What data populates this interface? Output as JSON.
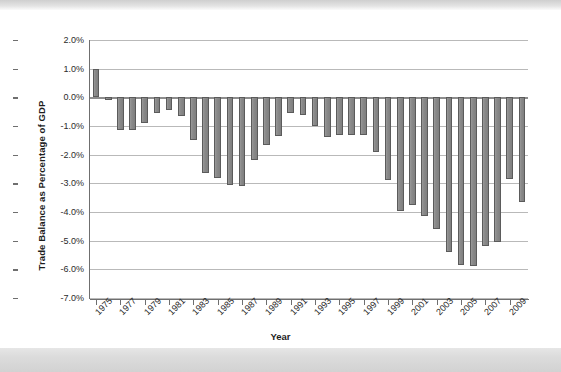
{
  "chart_data": {
    "type": "bar",
    "title": "",
    "xlabel": "Year",
    "ylabel": "Trade Balance as Percentage of GDP",
    "ylim": [
      -7.0,
      2.0
    ],
    "ystep": 1.0,
    "yticks": [
      "2.0%",
      "1.0%",
      "0.0%",
      "-1.0%",
      "-2.0%",
      "-3.0%",
      "-4.0%",
      "-5.0%",
      "-6.0%",
      "-7.0%"
    ],
    "ytick_values": [
      2.0,
      1.0,
      0.0,
      -1.0,
      -2.0,
      -3.0,
      -4.0,
      -5.0,
      -6.0,
      -7.0
    ],
    "xticks": [
      "1975",
      "1977",
      "1979",
      "1981",
      "1983",
      "1985",
      "1987",
      "1989",
      "1991",
      "1993",
      "1995",
      "1997",
      "1999",
      "2001",
      "2003",
      "2005",
      "2007",
      "2009"
    ],
    "grid": true,
    "legend": "none",
    "units": "percent of GDP",
    "bar_color": "#8a8a8a",
    "bar_edge_color": "#5b5b5b",
    "categories": [
      1975,
      1976,
      1977,
      1978,
      1979,
      1980,
      1981,
      1982,
      1983,
      1984,
      1985,
      1986,
      1987,
      1988,
      1989,
      1990,
      1991,
      1992,
      1993,
      1994,
      1995,
      1996,
      1997,
      1998,
      1999,
      2000,
      2001,
      2002,
      2003,
      2004,
      2005,
      2006,
      2007,
      2008,
      2009,
      2010
    ],
    "values": [
      1.0,
      -0.1,
      -1.15,
      -1.15,
      -0.9,
      -0.55,
      -0.45,
      -0.65,
      -1.5,
      -2.65,
      -2.8,
      -3.05,
      -3.1,
      -2.2,
      -1.65,
      -1.35,
      -0.55,
      -0.6,
      -1.0,
      -1.4,
      -1.3,
      -1.3,
      -1.3,
      -1.9,
      -2.9,
      -3.95,
      -3.75,
      -4.15,
      -4.6,
      -5.4,
      -5.85,
      -5.9,
      -5.2,
      -5.05,
      -2.85,
      -3.65
    ]
  }
}
